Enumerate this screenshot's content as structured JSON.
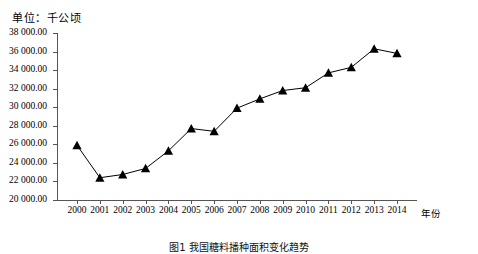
{
  "unit_label": "单位：千公顷",
  "caption": "图1  我国糖料播种面积变化趋势",
  "axis": {
    "x_title": "年份",
    "y_tick_labels": [
      "38 000.00",
      "36 000.00",
      "34 000.00",
      "32 000.00",
      "30 000.00",
      "28 000.00",
      "26 000.00",
      "24 000.00",
      "22 000.00",
      "20 000.00"
    ]
  },
  "colors": {
    "line": "#000000",
    "marker": "#000000",
    "axis": "#555555",
    "background": "#ffffff"
  },
  "chart_data": {
    "type": "line",
    "title": "",
    "xlabel": "年份",
    "ylabel": "",
    "unit": "千公顷",
    "grid": false,
    "legend": "none",
    "marker": "triangle",
    "ylim": [
      20000,
      38000
    ],
    "ytick_step": 2000,
    "categories": [
      "2000",
      "2001",
      "2002",
      "2003",
      "2004",
      "2005",
      "2006",
      "2007",
      "2008",
      "2009",
      "2010",
      "2011",
      "2012",
      "2013",
      "2014"
    ],
    "x": [
      2000,
      2001,
      2002,
      2003,
      2004,
      2005,
      2006,
      2007,
      2008,
      2009,
      2010,
      2011,
      2012,
      2013,
      2014
    ],
    "values": [
      25900,
      22400,
      22750,
      23400,
      25300,
      27700,
      27400,
      29900,
      30900,
      31800,
      32100,
      33700,
      34300,
      36300,
      35800
    ],
    "series": [
      {
        "name": "播种面积",
        "values": [
          25900,
          22400,
          22750,
          23400,
          25300,
          27700,
          27400,
          29900,
          30900,
          31800,
          32100,
          33700,
          34300,
          36300,
          35800
        ]
      }
    ]
  }
}
